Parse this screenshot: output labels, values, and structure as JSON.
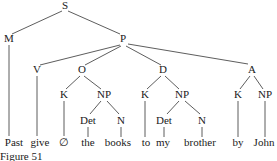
{
  "diagram": {
    "type": "syntax-tree",
    "caption": "Figure 51",
    "nodes": {
      "S": {
        "label": "S",
        "x": 65,
        "y": 9
      },
      "M": {
        "label": "M",
        "x": 9,
        "y": 42
      },
      "P": {
        "label": "P",
        "x": 123,
        "y": 42
      },
      "V": {
        "label": "V",
        "x": 37,
        "y": 73
      },
      "O": {
        "label": "O",
        "x": 82,
        "y": 73
      },
      "D": {
        "label": "D",
        "x": 163,
        "y": 73
      },
      "A": {
        "label": "A",
        "x": 252,
        "y": 73
      },
      "O_K": {
        "label": "K",
        "x": 64,
        "y": 98
      },
      "O_NP": {
        "label": "NP",
        "x": 104,
        "y": 98
      },
      "D_K": {
        "label": "K",
        "x": 145,
        "y": 98
      },
      "D_NP": {
        "label": "NP",
        "x": 182,
        "y": 98
      },
      "A_K": {
        "label": "K",
        "x": 238,
        "y": 98
      },
      "A_NP": {
        "label": "NP",
        "x": 265,
        "y": 98
      },
      "O_Det": {
        "label": "Det",
        "x": 88,
        "y": 124
      },
      "O_N": {
        "label": "N",
        "x": 121,
        "y": 124
      },
      "D_Det": {
        "label": "Det",
        "x": 164,
        "y": 124
      },
      "D_N": {
        "label": "N",
        "x": 202,
        "y": 124
      }
    },
    "leaves": {
      "past": {
        "label": "Past",
        "x": 14,
        "y": 146
      },
      "give": {
        "label": "give",
        "x": 40,
        "y": 146
      },
      "null": {
        "label": "∅",
        "x": 64,
        "y": 146
      },
      "the": {
        "label": "the",
        "x": 88,
        "y": 146
      },
      "books": {
        "label": "books",
        "x": 118,
        "y": 146
      },
      "to": {
        "label": "to",
        "x": 146,
        "y": 146
      },
      "my": {
        "label": "my",
        "x": 163,
        "y": 146
      },
      "brother": {
        "label": "brother",
        "x": 200,
        "y": 146
      },
      "by": {
        "label": "by",
        "x": 238,
        "y": 146
      },
      "john": {
        "label": "John",
        "x": 264,
        "y": 146
      }
    }
  }
}
